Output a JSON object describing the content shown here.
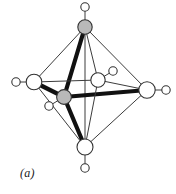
{
  "figure": {
    "caption": "(a)",
    "colors": {
      "background": "#ffffff",
      "edge_thin": "#3c3c3c",
      "edge_thick": "#111111",
      "vertex_fill_open": "#ffffff",
      "vertex_fill_shaded": "#b9b9b9",
      "vertex_stroke": "#333333",
      "caption_color": "#1a1a1a"
    }
  },
  "chart_data": {
    "type": "diagram",
    "title": "(a)",
    "subtitle": "",
    "xlabel": "",
    "ylabel": "",
    "grid": false,
    "legend": false,
    "atoms": [
      {
        "id": "apex-top-ligand",
        "label": "",
        "x": 85,
        "y": 7,
        "r": 4.2,
        "style": "open",
        "role": "terminal-ligand"
      },
      {
        "id": "vertex-top",
        "label": "",
        "x": 85,
        "y": 27,
        "r": 7.2,
        "style": "shaded",
        "role": "polyhedron-vertex"
      },
      {
        "id": "left-ligand",
        "label": "",
        "x": 16,
        "y": 82,
        "r": 4.2,
        "style": "open",
        "role": "terminal-ligand"
      },
      {
        "id": "vertex-left",
        "label": "",
        "x": 34,
        "y": 82,
        "r": 7.8,
        "style": "open",
        "role": "polyhedron-vertex"
      },
      {
        "id": "vertex-center",
        "label": "",
        "x": 64,
        "y": 97,
        "r": 7.4,
        "style": "shaded",
        "role": "polyhedron-vertex"
      },
      {
        "id": "center-ligand",
        "label": "",
        "x": 49,
        "y": 106,
        "r": 4.2,
        "style": "open",
        "role": "terminal-ligand"
      },
      {
        "id": "vertex-mid",
        "label": "",
        "x": 98,
        "y": 80,
        "r": 7.2,
        "style": "open",
        "role": "polyhedron-vertex"
      },
      {
        "id": "mid-ligand",
        "label": "",
        "x": 113,
        "y": 71,
        "r": 4.2,
        "style": "open",
        "role": "terminal-ligand"
      },
      {
        "id": "vertex-right",
        "label": "",
        "x": 147,
        "y": 90,
        "r": 8.2,
        "style": "open",
        "role": "polyhedron-vertex"
      },
      {
        "id": "right-ligand",
        "label": "",
        "x": 166,
        "y": 90,
        "r": 4.2,
        "style": "open",
        "role": "terminal-ligand"
      },
      {
        "id": "vertex-bottom",
        "label": "",
        "x": 85,
        "y": 147,
        "r": 8.0,
        "style": "open",
        "role": "polyhedron-vertex"
      },
      {
        "id": "bottom-ligand",
        "label": "",
        "x": 85,
        "y": 168,
        "r": 4.2,
        "style": "open",
        "role": "terminal-ligand"
      }
    ],
    "bonds": [
      {
        "from": "vertex-top",
        "to": "vertex-left",
        "weight": "thin"
      },
      {
        "from": "vertex-top",
        "to": "vertex-right",
        "weight": "thin"
      },
      {
        "from": "vertex-top",
        "to": "vertex-mid",
        "weight": "thin"
      },
      {
        "from": "vertex-top",
        "to": "vertex-bottom",
        "weight": "thin"
      },
      {
        "from": "vertex-top",
        "to": "vertex-center",
        "weight": "thick"
      },
      {
        "from": "vertex-left",
        "to": "vertex-bottom",
        "weight": "thin"
      },
      {
        "from": "vertex-left",
        "to": "vertex-mid",
        "weight": "thin"
      },
      {
        "from": "vertex-left",
        "to": "vertex-center",
        "weight": "thick"
      },
      {
        "from": "vertex-center",
        "to": "vertex-right",
        "weight": "thick"
      },
      {
        "from": "vertex-center",
        "to": "vertex-bottom",
        "weight": "thick"
      },
      {
        "from": "vertex-mid",
        "to": "vertex-right",
        "weight": "thin"
      },
      {
        "from": "vertex-mid",
        "to": "vertex-bottom",
        "weight": "thin"
      },
      {
        "from": "vertex-right",
        "to": "vertex-bottom",
        "weight": "thin"
      },
      {
        "from": "vertex-top",
        "to": "apex-top-ligand",
        "weight": "thin"
      },
      {
        "from": "vertex-left",
        "to": "left-ligand",
        "weight": "thin"
      },
      {
        "from": "vertex-center",
        "to": "center-ligand",
        "weight": "thin"
      },
      {
        "from": "vertex-mid",
        "to": "mid-ligand",
        "weight": "thin"
      },
      {
        "from": "vertex-right",
        "to": "right-ligand",
        "weight": "thin"
      },
      {
        "from": "vertex-bottom",
        "to": "bottom-ligand",
        "weight": "thin"
      }
    ]
  }
}
